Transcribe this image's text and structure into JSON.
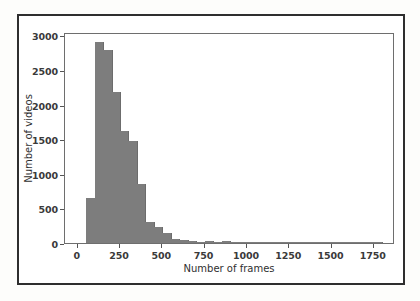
{
  "chart_data": {
    "type": "bar",
    "title": "",
    "subtitle": "",
    "xlabel": "Number of frames",
    "ylabel": "Number of videos",
    "xlim": [
      -75,
      1875
    ],
    "ylim": [
      0,
      3050
    ],
    "grid": false,
    "legend": null,
    "bin_width": 50,
    "bar_color": "#7d7d7d",
    "xticks": [
      0,
      250,
      500,
      750,
      1000,
      1250,
      1500,
      1750
    ],
    "xticklabels": [
      "0",
      "250",
      "500",
      "750",
      "1000",
      "1250",
      "1500",
      "1750"
    ],
    "yticks": [
      0,
      500,
      1000,
      1500,
      2000,
      2500,
      3000
    ],
    "yticklabels": [
      "0",
      "500",
      "1000",
      "1500",
      "2000",
      "2500",
      "3000"
    ],
    "bins": [
      {
        "x0": 50,
        "x1": 100,
        "value": 655
      },
      {
        "x0": 100,
        "x1": 150,
        "value": 2900
      },
      {
        "x0": 150,
        "x1": 200,
        "value": 2790
      },
      {
        "x0": 200,
        "x1": 250,
        "value": 2180
      },
      {
        "x0": 250,
        "x1": 300,
        "value": 1620
      },
      {
        "x0": 300,
        "x1": 350,
        "value": 1480
      },
      {
        "x0": 350,
        "x1": 400,
        "value": 860
      },
      {
        "x0": 400,
        "x1": 450,
        "value": 300
      },
      {
        "x0": 450,
        "x1": 500,
        "value": 230
      },
      {
        "x0": 500,
        "x1": 550,
        "value": 140
      },
      {
        "x0": 550,
        "x1": 600,
        "value": 55
      },
      {
        "x0": 600,
        "x1": 650,
        "value": 45
      },
      {
        "x0": 650,
        "x1": 700,
        "value": 22
      },
      {
        "x0": 700,
        "x1": 750,
        "value": 14
      },
      {
        "x0": 750,
        "x1": 800,
        "value": 30
      },
      {
        "x0": 800,
        "x1": 850,
        "value": 12
      },
      {
        "x0": 850,
        "x1": 900,
        "value": 26
      },
      {
        "x0": 900,
        "x1": 950,
        "value": 10
      },
      {
        "x0": 950,
        "x1": 1000,
        "value": 8
      },
      {
        "x0": 1000,
        "x1": 1050,
        "value": 6
      },
      {
        "x0": 1050,
        "x1": 1100,
        "value": 5
      },
      {
        "x0": 1100,
        "x1": 1150,
        "value": 4
      },
      {
        "x0": 1150,
        "x1": 1200,
        "value": 4
      },
      {
        "x0": 1200,
        "x1": 1250,
        "value": 3
      },
      {
        "x0": 1250,
        "x1": 1300,
        "value": 3
      },
      {
        "x0": 1300,
        "x1": 1350,
        "value": 2
      },
      {
        "x0": 1350,
        "x1": 1400,
        "value": 2
      },
      {
        "x0": 1400,
        "x1": 1450,
        "value": 2
      },
      {
        "x0": 1450,
        "x1": 1500,
        "value": 1
      },
      {
        "x0": 1500,
        "x1": 1550,
        "value": 1
      },
      {
        "x0": 1550,
        "x1": 1600,
        "value": 1
      },
      {
        "x0": 1600,
        "x1": 1650,
        "value": 1
      },
      {
        "x0": 1650,
        "x1": 1700,
        "value": 1
      },
      {
        "x0": 1700,
        "x1": 1750,
        "value": 1
      },
      {
        "x0": 1750,
        "x1": 1800,
        "value": 1
      }
    ]
  }
}
